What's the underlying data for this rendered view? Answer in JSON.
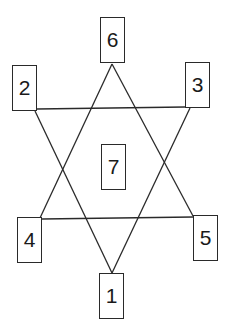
{
  "diagram": {
    "line_color": "#2a2a2a",
    "nodes": [
      {
        "id": "6",
        "label": "6",
        "position": "top",
        "x": 100,
        "y": 17
      },
      {
        "id": "2",
        "label": "2",
        "position": "upper-left",
        "x": 12,
        "y": 65
      },
      {
        "id": "3",
        "label": "3",
        "position": "upper-right",
        "x": 185,
        "y": 62
      },
      {
        "id": "7",
        "label": "7",
        "position": "center",
        "x": 101,
        "y": 144
      },
      {
        "id": "4",
        "label": "4",
        "position": "lower-left",
        "x": 17,
        "y": 217
      },
      {
        "id": "5",
        "label": "5",
        "position": "lower-right",
        "x": 193,
        "y": 215
      },
      {
        "id": "1",
        "label": "1",
        "position": "bottom",
        "x": 99,
        "y": 273
      }
    ],
    "triangles": [
      {
        "name": "upward-triangle",
        "vertices": [
          "6",
          "4",
          "5"
        ]
      },
      {
        "name": "downward-triangle",
        "vertices": [
          "2",
          "3",
          "1"
        ]
      }
    ]
  }
}
